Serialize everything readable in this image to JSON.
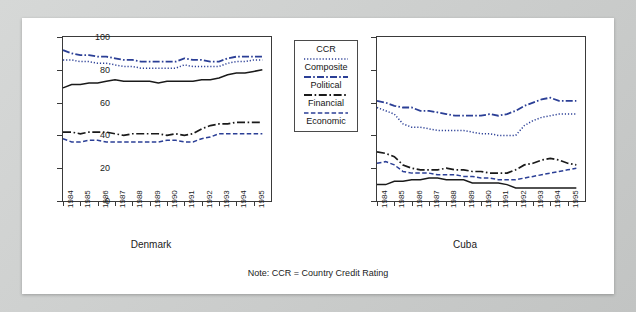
{
  "figure": {
    "note": "Note: CCR = Country Credit Rating",
    "axis": {
      "yticks": [
        0,
        20,
        40,
        60,
        80,
        100
      ],
      "ylim": [
        0,
        100
      ],
      "xticks": [
        "1984",
        "1985",
        "1986",
        "1987",
        "1988",
        "1989",
        "1990",
        "1991",
        "1992",
        "1993",
        "1994",
        "1995"
      ],
      "xlim": [
        1984,
        1996
      ]
    },
    "legend": {
      "title": "CCR",
      "entries": [
        {
          "label": "CCR",
          "style": "solid",
          "color": "#1a1a1a"
        },
        {
          "label": "Composite",
          "style": "dotted",
          "color": "#2b3f96"
        },
        {
          "label": "Political",
          "style": "dashdot",
          "color": "#2b3f96"
        },
        {
          "label": "Financial",
          "style": "dashdot2",
          "color": "#1a1a1a"
        },
        {
          "label": "Economic",
          "style": "dashed",
          "color": "#2b3f96"
        }
      ]
    }
  },
  "chart_data": [
    {
      "type": "line",
      "title": "Denmark",
      "xlabel": "",
      "ylabel": "",
      "ylim": [
        0,
        100
      ],
      "xlim": [
        1984,
        1996
      ],
      "grid": false,
      "legend_position": "center",
      "x": [
        1984.0,
        1984.5,
        1985.0,
        1985.5,
        1986.0,
        1986.5,
        1987.0,
        1987.5,
        1988.0,
        1988.5,
        1989.0,
        1989.5,
        1990.0,
        1990.5,
        1991.0,
        1991.5,
        1992.0,
        1992.5,
        1993.0,
        1993.5,
        1994.0,
        1994.5,
        1995.0,
        1995.5
      ],
      "series": [
        {
          "name": "CCR",
          "style": "solid",
          "color": "#1a1a1a",
          "values": [
            69,
            71,
            71,
            72,
            72,
            73,
            74,
            73,
            73,
            73,
            73,
            72,
            73,
            73,
            73,
            73,
            74,
            74,
            75,
            77,
            78,
            78,
            79,
            80
          ]
        },
        {
          "name": "Composite",
          "style": "dotted",
          "color": "#2b3f96",
          "values": [
            86,
            86,
            85,
            85,
            84,
            84,
            83,
            82,
            82,
            81,
            81,
            81,
            81,
            81,
            83,
            82,
            82,
            82,
            82,
            84,
            85,
            85,
            86,
            86
          ]
        },
        {
          "name": "Political",
          "style": "dashdot",
          "color": "#2b3f96",
          "values": [
            92,
            90,
            89,
            89,
            88,
            88,
            87,
            86,
            86,
            85,
            85,
            85,
            85,
            85,
            87,
            86,
            86,
            85,
            85,
            87,
            88,
            88,
            88,
            88
          ]
        },
        {
          "name": "Financial",
          "style": "dashdot2",
          "color": "#1a1a1a",
          "values": [
            42,
            42,
            41,
            42,
            42,
            42,
            41,
            40,
            41,
            41,
            41,
            41,
            40,
            41,
            40,
            41,
            44,
            46,
            47,
            47,
            48,
            48,
            48,
            48
          ]
        },
        {
          "name": "Economic",
          "style": "dashed",
          "color": "#2b3f96",
          "values": [
            38,
            36,
            36,
            37,
            37,
            36,
            36,
            36,
            36,
            36,
            36,
            36,
            37,
            37,
            36,
            36,
            38,
            39,
            41,
            41,
            41,
            41,
            41,
            41
          ]
        }
      ]
    },
    {
      "type": "line",
      "title": "Cuba",
      "xlabel": "",
      "ylabel": "",
      "ylim": [
        0,
        100
      ],
      "xlim": [
        1984,
        1996
      ],
      "grid": false,
      "legend_position": "none",
      "x": [
        1984.0,
        1984.5,
        1985.0,
        1985.5,
        1986.0,
        1986.5,
        1987.0,
        1987.5,
        1988.0,
        1988.5,
        1989.0,
        1989.5,
        1990.0,
        1990.5,
        1991.0,
        1991.5,
        1992.0,
        1992.5,
        1993.0,
        1993.5,
        1994.0,
        1994.5,
        1995.0,
        1995.5
      ],
      "series": [
        {
          "name": "CCR",
          "style": "solid",
          "color": "#1a1a1a",
          "values": [
            10,
            10,
            12,
            12,
            13,
            13,
            14,
            14,
            13,
            13,
            13,
            11,
            11,
            11,
            11,
            10,
            8,
            8,
            8,
            8,
            8,
            8,
            8,
            8
          ]
        },
        {
          "name": "Composite",
          "style": "dotted",
          "color": "#2b3f96",
          "values": [
            57,
            55,
            53,
            47,
            45,
            45,
            44,
            43,
            43,
            43,
            43,
            42,
            41,
            41,
            40,
            40,
            40,
            46,
            49,
            51,
            52,
            53,
            53,
            53
          ]
        },
        {
          "name": "Political",
          "style": "dashdot",
          "color": "#2b3f96",
          "values": [
            61,
            60,
            58,
            57,
            57,
            55,
            55,
            54,
            53,
            52,
            52,
            52,
            52,
            53,
            52,
            53,
            55,
            58,
            60,
            62,
            63,
            61,
            61,
            61
          ]
        },
        {
          "name": "Financial",
          "style": "dashdot2",
          "color": "#1a1a1a",
          "values": [
            30,
            29,
            27,
            22,
            20,
            19,
            19,
            19,
            20,
            19,
            19,
            18,
            18,
            17,
            17,
            17,
            19,
            22,
            23,
            25,
            26,
            25,
            23,
            22
          ]
        },
        {
          "name": "Economic",
          "style": "dashed",
          "color": "#2b3f96",
          "values": [
            23,
            24,
            22,
            18,
            17,
            17,
            17,
            16,
            16,
            16,
            15,
            15,
            14,
            14,
            13,
            13,
            13,
            14,
            15,
            16,
            17,
            18,
            19,
            20
          ]
        }
      ]
    }
  ]
}
